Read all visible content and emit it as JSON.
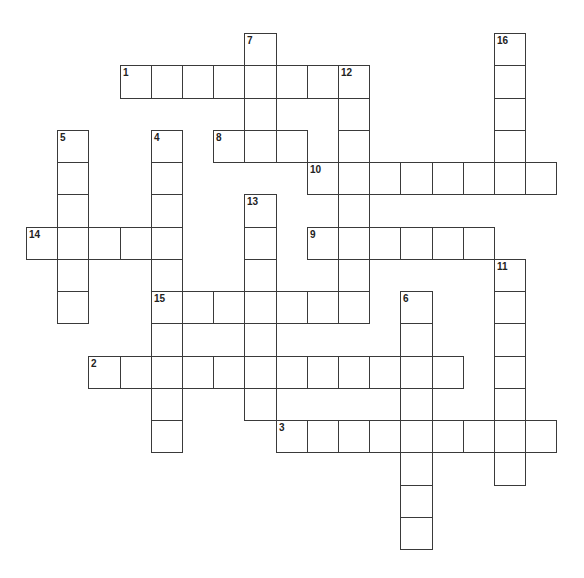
{
  "puzzle": {
    "type": "crossword",
    "layout": {
      "origin_x": 26,
      "origin_y": 33,
      "cell_w": 31.2,
      "cell_h": 32.25
    },
    "line_color": "#3a3a3a",
    "entries": [
      {
        "number": "1",
        "direction": "across",
        "row": 1,
        "col": 3,
        "length": 8
      },
      {
        "number": "2",
        "direction": "across",
        "row": 10,
        "col": 2,
        "length": 12
      },
      {
        "number": "3",
        "direction": "across",
        "row": 12,
        "col": 8,
        "length": 9
      },
      {
        "number": "4",
        "direction": "down",
        "row": 3,
        "col": 4,
        "length": 10
      },
      {
        "number": "5",
        "direction": "down",
        "row": 3,
        "col": 1,
        "length": 6
      },
      {
        "number": "6",
        "direction": "down",
        "row": 8,
        "col": 12,
        "length": 8
      },
      {
        "number": "7",
        "direction": "down",
        "row": 0,
        "col": 7,
        "length": 4
      },
      {
        "number": "8",
        "direction": "across",
        "row": 3,
        "col": 6,
        "length": 3
      },
      {
        "number": "9",
        "direction": "across",
        "row": 6,
        "col": 9,
        "length": 6
      },
      {
        "number": "10",
        "direction": "across",
        "row": 4,
        "col": 9,
        "length": 8
      },
      {
        "number": "11",
        "direction": "down",
        "row": 7,
        "col": 15,
        "length": 7
      },
      {
        "number": "12",
        "direction": "down",
        "row": 1,
        "col": 10,
        "length": 8
      },
      {
        "number": "13",
        "direction": "down",
        "row": 5,
        "col": 7,
        "length": 7
      },
      {
        "number": "14",
        "direction": "across",
        "row": 6,
        "col": 0,
        "length": 5
      },
      {
        "number": "15",
        "direction": "across",
        "row": 8,
        "col": 4,
        "length": 7
      },
      {
        "number": "16",
        "direction": "down",
        "row": 0,
        "col": 15,
        "length": 5
      }
    ]
  }
}
